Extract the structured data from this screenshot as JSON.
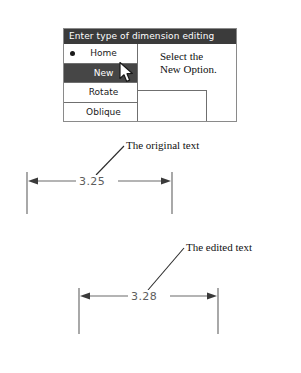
{
  "menu": {
    "title": "Enter type of dimension editing",
    "items": [
      {
        "label": "Home",
        "selected": false,
        "bullet": true
      },
      {
        "label": "New",
        "selected": true,
        "bullet": false
      },
      {
        "label": "Rotate",
        "selected": false,
        "bullet": false
      },
      {
        "label": "Oblique",
        "selected": false,
        "bullet": false
      }
    ],
    "cursor_icon": "mouse-pointer-icon",
    "colors": {
      "title_bar": "#3b3b3b",
      "title_text": "#ffffff",
      "selected_row": "#464646",
      "selected_text": "#ffffff",
      "border": "#8a8a8a",
      "panel_background": "#ffffff"
    }
  },
  "callouts": {
    "select_new": "Select the\nNew Option.",
    "original_text": "The original text",
    "edited_text": "The edited text"
  },
  "dimensions": [
    {
      "name": "original-dimension",
      "value": "3.25",
      "caption": "The original text",
      "arrow_style": "double-arrow",
      "text_color": "#5d5d5d"
    },
    {
      "name": "edited-dimension",
      "value": "3.28",
      "caption": "The edited text",
      "arrow_style": "double-arrow",
      "text_color": "#5d5d5d"
    }
  ],
  "line_colors": {
    "extension_line": "#7a7a7a",
    "dimension_line": "#6b6b6b",
    "leader_line": "#2b2b2b",
    "arrowhead": "#3a3a3a"
  }
}
